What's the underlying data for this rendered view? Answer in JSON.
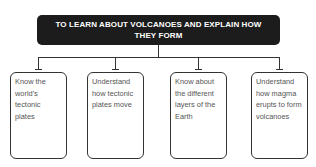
{
  "diagram": {
    "title": "TO LEARN ABOUT VOLCANOES AND EXPLAIN HOW THEY FORM",
    "colors": {
      "title_background": "#1c1c1c",
      "title_text": "#ffffff",
      "connector": "#333333",
      "box_border": "#333333",
      "box_text": "#555555"
    },
    "objectives": [
      {
        "text": "Know the world's tectonic plates"
      },
      {
        "text": "Understand how tectonic plates move"
      },
      {
        "text": "Know about the different layers of the Earth"
      },
      {
        "text": "Understand how magma erupts to form volcanoes"
      }
    ]
  }
}
